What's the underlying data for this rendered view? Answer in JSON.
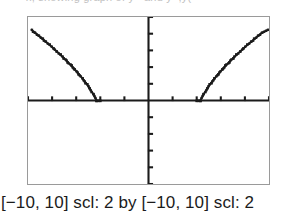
{
  "figure": {
    "kind": "graphing-calculator-screen",
    "top_cutoff_text": "x, showing graph of y= and y=,y(",
    "caption": "[−10, 10] scl: 2 by [−10, 10] scl: 2",
    "colors": {
      "ink": "#1b1b1b",
      "frame": "#9a9a9a",
      "background": "#ffffff"
    }
  },
  "chart_data": {
    "type": "line",
    "title": "",
    "subtitle": "",
    "xlabel": "",
    "ylabel": "",
    "xlim": [
      -10,
      10
    ],
    "ylim": [
      -10,
      10
    ],
    "x_scale": 2,
    "y_scale": 2,
    "grid": false,
    "legend": null,
    "axes": {
      "x_axis_visible": true,
      "y_axis_visible": true,
      "x_tick_interval": 2,
      "y_tick_interval": 2,
      "x_ticks": [
        -10,
        -8,
        -6,
        -4,
        -2,
        0,
        2,
        4,
        6,
        8,
        10
      ],
      "y_ticks": [
        -10,
        -8,
        -6,
        -4,
        -2,
        0,
        2,
        4,
        6,
        8,
        10
      ],
      "tick_labels_shown": false
    },
    "series": [
      {
        "name": "left branch",
        "equation": "y = sqrt(x^2 - 16), x <= -4",
        "points": [
          [
            -9.7,
            8.45
          ],
          [
            -9.4,
            8.1
          ],
          [
            -9.1,
            7.74
          ],
          [
            -8.8,
            7.38
          ],
          [
            -8.5,
            7.01
          ],
          [
            -8.2,
            6.64
          ],
          [
            -7.9,
            6.25
          ],
          [
            -7.6,
            5.86
          ],
          [
            -7.3,
            5.45
          ],
          [
            -7.0,
            5.04
          ],
          [
            -6.7,
            4.6
          ],
          [
            -6.4,
            4.15
          ],
          [
            -6.1,
            3.68
          ],
          [
            -5.8,
            3.19
          ],
          [
            -5.5,
            2.67
          ],
          [
            -5.2,
            2.11
          ],
          [
            -4.9,
            1.5
          ],
          [
            -4.6,
            0.81
          ],
          [
            -4.3,
            0.0
          ],
          [
            -4.0,
            0.0
          ]
        ]
      },
      {
        "name": "right branch",
        "equation": "y = sqrt(x^2 - 16), x >= 4",
        "points": [
          [
            4.0,
            0.0
          ],
          [
            4.3,
            0.0
          ],
          [
            4.6,
            0.81
          ],
          [
            4.9,
            1.5
          ],
          [
            5.2,
            2.11
          ],
          [
            5.5,
            2.67
          ],
          [
            5.8,
            3.19
          ],
          [
            6.1,
            3.68
          ],
          [
            6.4,
            4.15
          ],
          [
            6.7,
            4.6
          ],
          [
            7.0,
            5.04
          ],
          [
            7.3,
            5.45
          ],
          [
            7.6,
            5.86
          ],
          [
            7.9,
            6.25
          ],
          [
            8.2,
            6.64
          ],
          [
            8.5,
            7.01
          ],
          [
            8.8,
            7.38
          ],
          [
            9.1,
            7.74
          ],
          [
            9.4,
            8.1
          ],
          [
            9.9,
            8.45
          ]
        ]
      }
    ]
  }
}
